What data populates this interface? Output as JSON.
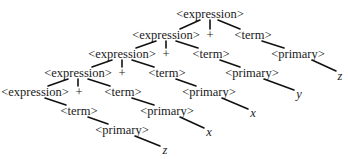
{
  "diagram": {
    "type": "parse-tree",
    "nodes": [
      {
        "id": "e1",
        "label": "<expression>",
        "x": 210,
        "y": 14,
        "kind": "nonterminal"
      },
      {
        "id": "e2",
        "label": "<expression>",
        "x": 166,
        "y": 35,
        "kind": "nonterminal"
      },
      {
        "id": "p1",
        "label": "+",
        "x": 210,
        "y": 35,
        "kind": "operator"
      },
      {
        "id": "t1",
        "label": "<term>",
        "x": 253,
        "y": 35,
        "kind": "nonterminal"
      },
      {
        "id": "e3",
        "label": "<expression>",
        "x": 122,
        "y": 54,
        "kind": "nonterminal"
      },
      {
        "id": "p2",
        "label": "+",
        "x": 166,
        "y": 54,
        "kind": "operator"
      },
      {
        "id": "t2",
        "label": "<term>",
        "x": 211,
        "y": 54,
        "kind": "nonterminal"
      },
      {
        "id": "pr1",
        "label": "<primary>",
        "x": 298,
        "y": 54,
        "kind": "nonterminal"
      },
      {
        "id": "e4",
        "label": "<expression>",
        "x": 78,
        "y": 73,
        "kind": "nonterminal"
      },
      {
        "id": "p3",
        "label": "+",
        "x": 122,
        "y": 73,
        "kind": "operator"
      },
      {
        "id": "t3",
        "label": "<term>",
        "x": 167,
        "y": 73,
        "kind": "nonterminal"
      },
      {
        "id": "pr2",
        "label": "<primary>",
        "x": 252,
        "y": 73,
        "kind": "nonterminal"
      },
      {
        "id": "z1",
        "label": "z",
        "x": 340,
        "y": 76,
        "kind": "terminal"
      },
      {
        "id": "e5",
        "label": "<expression>",
        "x": 35,
        "y": 92,
        "kind": "nonterminal"
      },
      {
        "id": "p4",
        "label": "+",
        "x": 79,
        "y": 92,
        "kind": "operator"
      },
      {
        "id": "t4",
        "label": "<term>",
        "x": 123,
        "y": 92,
        "kind": "nonterminal"
      },
      {
        "id": "pr3",
        "label": "<primary>",
        "x": 209,
        "y": 92,
        "kind": "nonterminal"
      },
      {
        "id": "y1",
        "label": "y",
        "x": 299,
        "y": 94,
        "kind": "terminal"
      },
      {
        "id": "t5",
        "label": "<term>",
        "x": 79,
        "y": 111,
        "kind": "nonterminal"
      },
      {
        "id": "pr4",
        "label": "<primary>",
        "x": 167,
        "y": 111,
        "kind": "nonterminal"
      },
      {
        "id": "x1",
        "label": "x",
        "x": 253,
        "y": 113,
        "kind": "terminal"
      },
      {
        "id": "pr5",
        "label": "<primary>",
        "x": 122,
        "y": 130,
        "kind": "nonterminal"
      },
      {
        "id": "x2",
        "label": "x",
        "x": 209,
        "y": 132,
        "kind": "terminal"
      },
      {
        "id": "z2",
        "label": "z",
        "x": 165,
        "y": 150,
        "kind": "terminal"
      }
    ],
    "edges": [
      {
        "x1": 200,
        "y1": 20,
        "x2": 180,
        "y2": 29
      },
      {
        "x1": 210,
        "y1": 20,
        "x2": 210,
        "y2": 29
      },
      {
        "x1": 218,
        "y1": 20,
        "x2": 240,
        "y2": 29
      },
      {
        "x1": 156,
        "y1": 41,
        "x2": 136,
        "y2": 48
      },
      {
        "x1": 166,
        "y1": 41,
        "x2": 166,
        "y2": 48
      },
      {
        "x1": 176,
        "y1": 41,
        "x2": 198,
        "y2": 48
      },
      {
        "x1": 262,
        "y1": 41,
        "x2": 284,
        "y2": 48
      },
      {
        "x1": 112,
        "y1": 60,
        "x2": 92,
        "y2": 67
      },
      {
        "x1": 122,
        "y1": 60,
        "x2": 122,
        "y2": 67
      },
      {
        "x1": 132,
        "y1": 60,
        "x2": 154,
        "y2": 67
      },
      {
        "x1": 220,
        "y1": 60,
        "x2": 240,
        "y2": 67
      },
      {
        "x1": 312,
        "y1": 60,
        "x2": 336,
        "y2": 71
      },
      {
        "x1": 68,
        "y1": 79,
        "x2": 48,
        "y2": 86
      },
      {
        "x1": 78,
        "y1": 79,
        "x2": 78,
        "y2": 86
      },
      {
        "x1": 88,
        "y1": 79,
        "x2": 110,
        "y2": 86
      },
      {
        "x1": 176,
        "y1": 79,
        "x2": 196,
        "y2": 86
      },
      {
        "x1": 264,
        "y1": 79,
        "x2": 294,
        "y2": 90
      },
      {
        "x1": 45,
        "y1": 98,
        "x2": 66,
        "y2": 105
      },
      {
        "x1": 132,
        "y1": 98,
        "x2": 154,
        "y2": 105
      },
      {
        "x1": 222,
        "y1": 98,
        "x2": 248,
        "y2": 109
      },
      {
        "x1": 88,
        "y1": 117,
        "x2": 108,
        "y2": 124
      },
      {
        "x1": 180,
        "y1": 117,
        "x2": 204,
        "y2": 128
      },
      {
        "x1": 135,
        "y1": 136,
        "x2": 160,
        "y2": 146
      }
    ]
  }
}
